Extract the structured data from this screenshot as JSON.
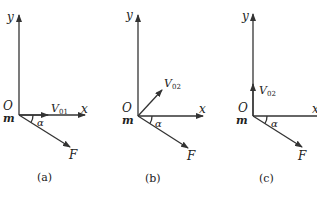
{
  "panels": [
    {
      "caption": "(a)",
      "axis_y": "y",
      "axis_x": "x",
      "origin": "O",
      "mass": "m",
      "velocity_label": "V",
      "velocity_sub": "01",
      "velocity_direction": "along +x",
      "angle": "α",
      "force": "F"
    },
    {
      "caption": "(b)",
      "axis_y": "y",
      "axis_x": "x",
      "origin": "O",
      "mass": "m",
      "velocity_label": "V",
      "velocity_sub": "02",
      "velocity_direction": "45° above +x",
      "angle": "α",
      "force": "F"
    },
    {
      "caption": "(c)",
      "axis_y": "y",
      "axis_x": "x",
      "origin": "O",
      "mass": "m",
      "velocity_label": "V",
      "velocity_sub": "02",
      "velocity_direction": "along +y",
      "angle": "α",
      "force": "F"
    }
  ]
}
